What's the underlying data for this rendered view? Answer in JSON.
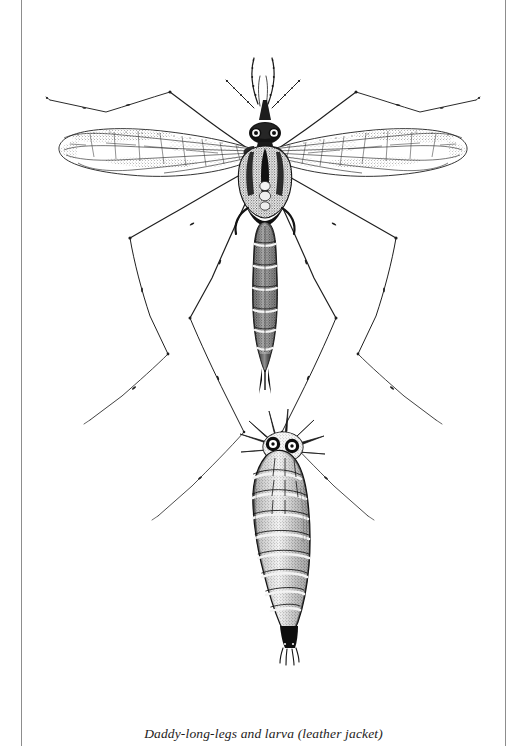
{
  "page": {
    "background_color": "#ffffff",
    "rule_color": "#8d8d8d",
    "ink_color": "#1a1a1a"
  },
  "caption": {
    "text": "Daddy-long-legs and larva (leather jacket)"
  },
  "illustration": {
    "title": "Daddy-long-legs and larva (leather jacket)",
    "medium": "pen-and-ink stipple engraving",
    "subjects": [
      {
        "name": "daddy-long-legs",
        "alt_name": "crane fly",
        "stage": "adult",
        "parts": [
          "antennae",
          "palps",
          "head",
          "compound eyes",
          "thorax",
          "halteres",
          "wings",
          "abdomen",
          "cerci",
          "legs"
        ],
        "leg_count": 6,
        "wing_count": 2
      },
      {
        "name": "leather jacket",
        "alt_name": "larva",
        "stage": "larva",
        "parts": [
          "spiracular disc",
          "lobes",
          "spiracles",
          "body segments",
          "head"
        ],
        "segment_count": 10
      }
    ]
  }
}
